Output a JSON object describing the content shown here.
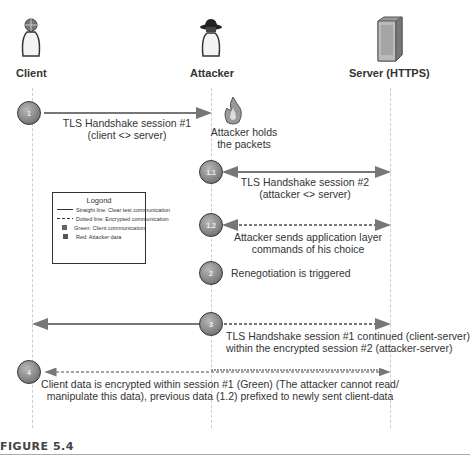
{
  "actors": {
    "client": {
      "label": "Client",
      "icon": "user-icon"
    },
    "attacker": {
      "label": "Attacker",
      "icon": "hacker-icon"
    },
    "server": {
      "label": "Server (HTTPS)",
      "icon": "server-icon"
    }
  },
  "messages": [
    {
      "id": "m1",
      "text_line1": "TLS Handshake session #1",
      "text_line2": "(client <> server)",
      "style": "solid",
      "from": "Client",
      "to": "Attacker"
    },
    {
      "id": "m1b",
      "text_line1": "Attacker holds",
      "text_line2": "the packets",
      "icon": "fire-icon"
    },
    {
      "id": "m2",
      "text_line1": "TLS Handshake session #2",
      "text_line2": "(attacker <> server)",
      "style": "solid",
      "from": "Attacker",
      "to": "Server"
    },
    {
      "id": "m3",
      "text_line1": "Attacker sends application layer",
      "text_line2": "commands of his choice",
      "style": "dotted",
      "from": "Attacker",
      "to": "Server"
    },
    {
      "id": "m4",
      "text_line1": "Renegotiation is triggered",
      "text_line2": ""
    },
    {
      "id": "m5",
      "text_line1": "TLS Handshake session #1 continued (client-server)",
      "text_line2": "within the encrypted session #2 (attacker-server)",
      "style": "solid+dotted",
      "from": "Attacker",
      "to": "Client/Server"
    },
    {
      "id": "m6",
      "text_line1": "Client data is encrypted within session #1 (Green) (The attacker cannot read/",
      "text_line2": "manipulate this data), previous data (1.2) prefixed to newly sent client-data",
      "style": "dotted",
      "from": "Client",
      "to": "Server"
    }
  ],
  "router_numbers": [
    "1",
    "1.1",
    "1.2",
    "2",
    "3",
    "4"
  ],
  "legend": {
    "title": "Logond",
    "items": [
      {
        "symbol": "solid-line",
        "text": "Straight line: Clear test communication"
      },
      {
        "symbol": "dotted-line",
        "text": "Dotted line: Encrypted communication"
      },
      {
        "symbol": "green-square",
        "text": "Green: Client communication"
      },
      {
        "symbol": "red-square",
        "text": "Red: Attacker data"
      }
    ]
  },
  "caption": "FIGURE 5.4",
  "colors": {
    "arrow": "#777777",
    "text": "#333333",
    "lifeline": "#cccccc"
  }
}
